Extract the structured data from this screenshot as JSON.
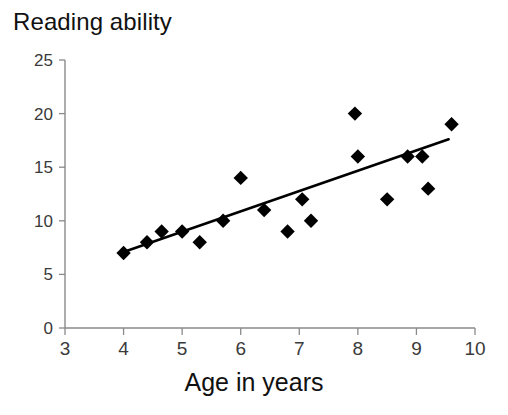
{
  "chart_data": {
    "type": "scatter",
    "title": "Reading ability",
    "xlabel": "Age in years",
    "ylabel": "",
    "xlim": [
      3,
      10
    ],
    "ylim": [
      0,
      25
    ],
    "xticks": [
      3,
      4,
      5,
      6,
      7,
      8,
      9,
      10
    ],
    "yticks": [
      0,
      5,
      10,
      15,
      20,
      25
    ],
    "xtick_labels": [
      "3",
      "4",
      "5",
      "6",
      "7",
      "8",
      "9",
      "10"
    ],
    "ytick_labels": [
      "0",
      "5",
      "10",
      "15",
      "20",
      "25"
    ],
    "grid": false,
    "legend": false,
    "marker": "diamond",
    "marker_color": "#000000",
    "points": [
      {
        "x": 4.0,
        "y": 7
      },
      {
        "x": 4.4,
        "y": 8
      },
      {
        "x": 4.65,
        "y": 9
      },
      {
        "x": 5.0,
        "y": 9
      },
      {
        "x": 5.3,
        "y": 8
      },
      {
        "x": 5.7,
        "y": 10
      },
      {
        "x": 6.0,
        "y": 14
      },
      {
        "x": 6.4,
        "y": 11
      },
      {
        "x": 6.8,
        "y": 9
      },
      {
        "x": 7.05,
        "y": 12
      },
      {
        "x": 7.2,
        "y": 10
      },
      {
        "x": 7.95,
        "y": 20
      },
      {
        "x": 8.0,
        "y": 16
      },
      {
        "x": 8.5,
        "y": 12
      },
      {
        "x": 8.85,
        "y": 16
      },
      {
        "x": 9.1,
        "y": 16
      },
      {
        "x": 9.2,
        "y": 13
      },
      {
        "x": 9.6,
        "y": 19
      }
    ],
    "trendline": {
      "type": "linear",
      "x_start": 3.95,
      "y_start": 7.0,
      "x_end": 9.55,
      "y_end": 17.6
    }
  },
  "colors": {
    "background": "#ffffff",
    "axis": "#8a8a8a",
    "text": "#111111",
    "tick_text": "#3a3a3a",
    "marker": "#000000",
    "trendline": "#000000"
  }
}
